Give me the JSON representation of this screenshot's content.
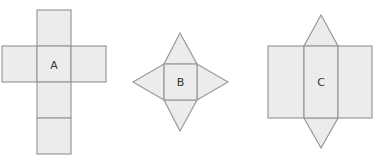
{
  "figure": {
    "colors": {
      "face_fill": "#ececec",
      "edge_stroke": "#9a9a9a",
      "label": "#333333"
    }
  },
  "nets": [
    {
      "label": "A",
      "shape": "cube net (cross of six squares)"
    },
    {
      "label": "B",
      "shape": "square pyramid net (square with four triangles)"
    },
    {
      "label": "C",
      "shape": "triangular prism net (three rectangles with two triangles)"
    }
  ]
}
